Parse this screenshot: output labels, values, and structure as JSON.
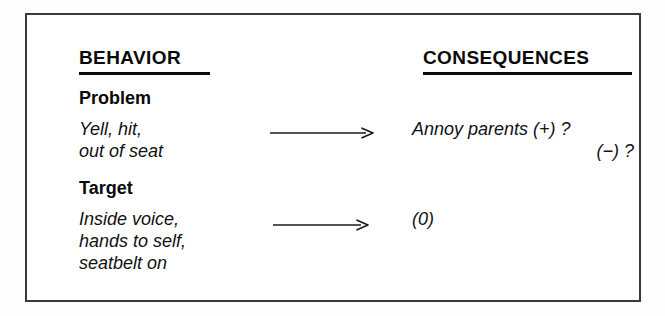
{
  "diagram": {
    "title_behavior": "BEHAVIOR",
    "title_consequences": "CONSEQUENCES",
    "rows": {
      "problem": {
        "label": "Problem",
        "behavior_line1": "Yell, hit,",
        "behavior_line2": "out of seat",
        "arrow": "right-arrow",
        "consequence_line1": "Annoy parents (+) ?",
        "consequence_line2": "(−) ?"
      },
      "target": {
        "label": "Target",
        "behavior_line1": "Inside voice,",
        "behavior_line2": "hands to self,",
        "behavior_line3": "seatbelt on",
        "arrow": "right-arrow",
        "consequence_line1": "(0)"
      }
    },
    "colors": {
      "ink": "#0a0a0a",
      "frame": "#3a3a3a",
      "background": "#ffffff"
    }
  }
}
